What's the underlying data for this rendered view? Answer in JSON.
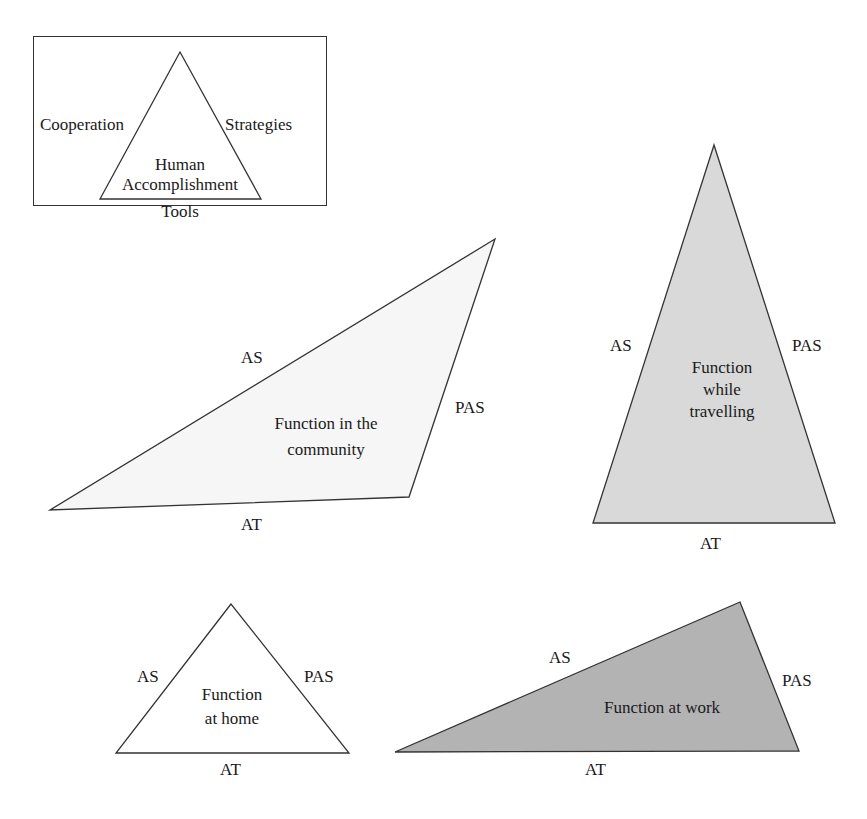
{
  "legend": {
    "triangle_sides": {
      "left": "Cooperation",
      "right": "Strategies",
      "bottom": "Tools"
    },
    "center_line1": "Human",
    "center_line2": "Accomplishment"
  },
  "triangles": [
    {
      "id": "community",
      "center_line1": "Function in the",
      "center_line2": "community",
      "left_side": "AS",
      "right_side": "PAS",
      "bottom_side": "AT",
      "fill": "#f6f6f6"
    },
    {
      "id": "travelling",
      "center_line1": "Function",
      "center_line2": "while",
      "center_line3": "travelling",
      "left_side": "AS",
      "right_side": "PAS",
      "bottom_side": "AT",
      "fill": "#d9d9d9"
    },
    {
      "id": "home",
      "center_line1": "Function",
      "center_line2": "at home",
      "left_side": "AS",
      "right_side": "PAS",
      "bottom_side": "AT",
      "fill": "#ffffff"
    },
    {
      "id": "work",
      "center_line1": "Function at work",
      "left_side": "AS",
      "right_side": "PAS",
      "bottom_side": "AT",
      "fill": "#b3b3b3"
    }
  ],
  "colors": {
    "stroke": "#333333",
    "text": "#1a1a1a"
  }
}
